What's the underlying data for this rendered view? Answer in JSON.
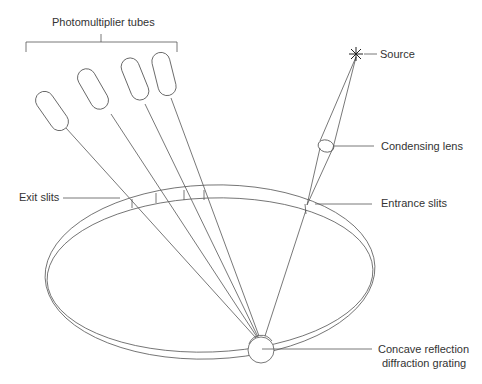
{
  "diagram": {
    "type": "spectrometer-schematic",
    "line_color": "#555555",
    "labels": {
      "photomultiplier_tubes": "Photomultiplier tubes",
      "source": "Source",
      "condensing_lens": "Condensing lens",
      "exit_slits": "Exit slits",
      "entrance_slits": "Entrance slits",
      "grating_line1": "Concave reflection",
      "grating_line2": "diffraction grating"
    }
  }
}
